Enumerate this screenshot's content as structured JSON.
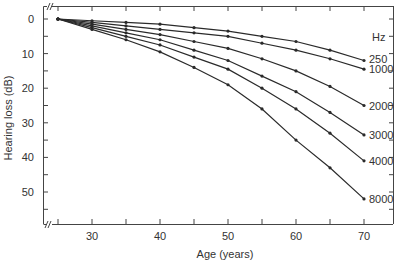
{
  "chart_data": {
    "type": "line",
    "title": "",
    "xlabel": "Age (years)",
    "ylabel": "Hearing loss (dB)",
    "x": [
      25,
      30,
      35,
      40,
      45,
      50,
      55,
      60,
      65,
      70
    ],
    "xlim": [
      25,
      74
    ],
    "ylim": [
      0,
      58
    ],
    "y_inverted": true,
    "x_ticks": [
      30,
      40,
      50,
      60,
      70
    ],
    "y_ticks": [
      0,
      10,
      20,
      30,
      40,
      50
    ],
    "grid": false,
    "axis_breaks": true,
    "legend_title": "Hz",
    "legend_position": "right, inline labels at line ends",
    "series": [
      {
        "name": "250",
        "values": [
          0,
          0.5,
          1,
          1.5,
          2.5,
          3.5,
          5,
          6.5,
          9,
          12
        ]
      },
      {
        "name": "1000",
        "values": [
          0,
          1,
          2,
          3,
          4,
          5,
          7,
          9,
          11.5,
          14.5
        ]
      },
      {
        "name": "2000",
        "values": [
          0,
          1.5,
          3,
          4.5,
          6.5,
          8.5,
          11.5,
          15,
          19.5,
          25
        ]
      },
      {
        "name": "3000",
        "values": [
          0,
          2,
          4,
          6,
          9,
          12,
          16.5,
          21,
          27,
          33.5
        ]
      },
      {
        "name": "4000",
        "values": [
          0,
          2.5,
          5,
          7.5,
          11,
          14.5,
          20,
          26,
          33,
          41
        ]
      },
      {
        "name": "8000",
        "values": [
          0,
          3,
          6,
          9.5,
          14,
          19,
          26,
          35,
          43,
          52
        ]
      }
    ]
  },
  "colors": {
    "line": "#2a2a2a",
    "axis": "#444444",
    "text": "#333333"
  }
}
